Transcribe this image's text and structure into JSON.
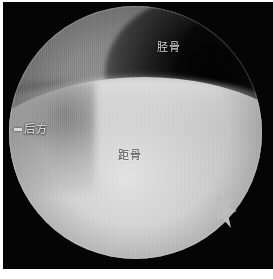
{
  "image": {
    "kind": "arthroscopy-photograph",
    "modality_label": "ankle arthroscopy circular field of view",
    "background_color": "#ffffff",
    "plate_color": "#050505"
  },
  "scope": {
    "shape": "circle",
    "field_diameter_px": 253,
    "rim_highlight_color": "#ffffff"
  },
  "regions": [
    {
      "id": "tibia",
      "position": "upper",
      "base_color": "#6a6a6a",
      "highlight_color": "#8d8d8d",
      "shadow_color": "#4a4a4a"
    },
    {
      "id": "talus",
      "position": "lower",
      "base_color": "#c4c4c4",
      "highlight_color": "#e2e2e2",
      "shadow_color": "#868686"
    },
    {
      "id": "joint-recess",
      "position": "upper-right",
      "base_color": "#0a0a0a"
    }
  ],
  "annotations": {
    "tibia": {
      "text": "胫骨",
      "color": "#d8d8d8"
    },
    "talus": {
      "text": "距骨",
      "color": "#4e4e4e"
    },
    "posterior": {
      "text": "后方",
      "color": "#efefef",
      "marker": "pointer-tick"
    }
  },
  "features": {
    "spur": {
      "name": "tissue-spur",
      "location": "lower-right-margin",
      "color": "#bdbdbd"
    }
  }
}
